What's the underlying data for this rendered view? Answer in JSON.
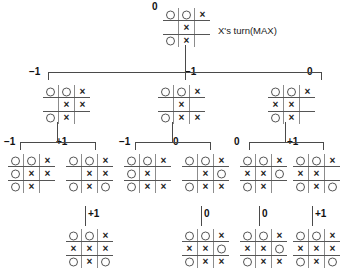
{
  "diagram": {
    "title_caption": "X's turn(MAX)",
    "glyphs": {
      "x": "×",
      "o": "circle-glyph",
      "empty": ""
    },
    "value_labels": {
      "root": "0",
      "level2": [
        "−1",
        "−1",
        "0"
      ],
      "level3": [
        "−1",
        "+1",
        "−1",
        "0",
        "0",
        "+1"
      ],
      "level4": [
        "+1",
        "0",
        "0",
        "+1"
      ]
    }
  },
  "nodes": {
    "root": {
      "value": "0",
      "cells": [
        [
          "O",
          "O",
          "X"
        ],
        [
          "",
          "X",
          ""
        ],
        [
          "O",
          "X",
          ""
        ]
      ]
    },
    "level2": [
      {
        "value": "−1",
        "cells": [
          [
            "O",
            "O",
            "X"
          ],
          [
            "",
            "X",
            "X"
          ],
          [
            "O",
            "X",
            ""
          ]
        ]
      },
      {
        "value": "−1",
        "cells": [
          [
            "O",
            "O",
            "X"
          ],
          [
            "",
            "X",
            ""
          ],
          [
            "O",
            "X",
            "X"
          ]
        ]
      },
      {
        "value": "0",
        "cells": [
          [
            "O",
            "O",
            "X"
          ],
          [
            "X",
            "X",
            ""
          ],
          [
            "O",
            "X",
            ""
          ]
        ]
      }
    ],
    "level3": [
      {
        "value": "−1",
        "cells": [
          [
            "O",
            "O",
            "X"
          ],
          [
            "O",
            "X",
            "X"
          ],
          [
            "O",
            "X",
            ""
          ]
        ]
      },
      {
        "value": "+1",
        "cells": [
          [
            "O",
            "O",
            "X"
          ],
          [
            "",
            "X",
            "X"
          ],
          [
            "O",
            "X",
            "O"
          ]
        ]
      },
      {
        "value": "−1",
        "cells": [
          [
            "O",
            "O",
            "X"
          ],
          [
            "O",
            "X",
            ""
          ],
          [
            "O",
            "X",
            "X"
          ]
        ]
      },
      {
        "value": "0",
        "cells": [
          [
            "O",
            "O",
            "X"
          ],
          [
            "",
            "X",
            "O"
          ],
          [
            "O",
            "X",
            "X"
          ]
        ]
      },
      {
        "value": "0",
        "cells": [
          [
            "O",
            "O",
            "X"
          ],
          [
            "X",
            "X",
            "O"
          ],
          [
            "O",
            "X",
            ""
          ]
        ]
      },
      {
        "value": "+1",
        "cells": [
          [
            "O",
            "O",
            "X"
          ],
          [
            "X",
            "X",
            ""
          ],
          [
            "O",
            "X",
            "O"
          ]
        ]
      }
    ],
    "level4": [
      {
        "value": "+1",
        "cells": [
          [
            "O",
            "O",
            "X"
          ],
          [
            "X",
            "X",
            "X"
          ],
          [
            "O",
            "X",
            "O"
          ]
        ]
      },
      {
        "value": "0",
        "cells": [
          [
            "O",
            "O",
            "X"
          ],
          [
            "X",
            "X",
            "O"
          ],
          [
            "O",
            "X",
            "X"
          ]
        ]
      },
      {
        "value": "0",
        "cells": [
          [
            "O",
            "O",
            "X"
          ],
          [
            "X",
            "X",
            "O"
          ],
          [
            "O",
            "X",
            "X"
          ]
        ]
      },
      {
        "value": "+1",
        "cells": [
          [
            "O",
            "O",
            "X"
          ],
          [
            "X",
            "X",
            "X"
          ],
          [
            "O",
            "X",
            "O"
          ]
        ]
      }
    ]
  },
  "layout": {
    "root_board": {
      "x": 163,
      "y": 8
    },
    "root_value": {
      "x": 152,
      "y": 2
    },
    "caption": {
      "x": 218,
      "y": 26
    },
    "level2_boards": [
      {
        "x": 43,
        "y": 85
      },
      {
        "x": 158,
        "y": 85
      },
      {
        "x": 268,
        "y": 85
      }
    ],
    "level2_values": [
      {
        "x": 29,
        "y": 67
      },
      {
        "x": 185,
        "y": 67
      },
      {
        "x": 307,
        "y": 67
      }
    ],
    "level3_boards": [
      {
        "x": 8,
        "y": 154
      },
      {
        "x": 66,
        "y": 154
      },
      {
        "x": 124,
        "y": 154
      },
      {
        "x": 182,
        "y": 154
      },
      {
        "x": 240,
        "y": 154
      },
      {
        "x": 293,
        "y": 154
      }
    ],
    "level3_values": [
      {
        "x": 4,
        "y": 137
      },
      {
        "x": 56,
        "y": 137
      },
      {
        "x": 119,
        "y": 137
      },
      {
        "x": 173,
        "y": 137
      },
      {
        "x": 234,
        "y": 137
      },
      {
        "x": 287,
        "y": 137
      }
    ],
    "level4_boards": [
      {
        "x": 66,
        "y": 229
      },
      {
        "x": 182,
        "y": 229
      },
      {
        "x": 240,
        "y": 229
      },
      {
        "x": 293,
        "y": 229
      }
    ],
    "level4_values": [
      {
        "x": 88,
        "y": 209
      },
      {
        "x": 204,
        "y": 209
      },
      {
        "x": 262,
        "y": 209
      },
      {
        "x": 315,
        "y": 209
      }
    ]
  }
}
